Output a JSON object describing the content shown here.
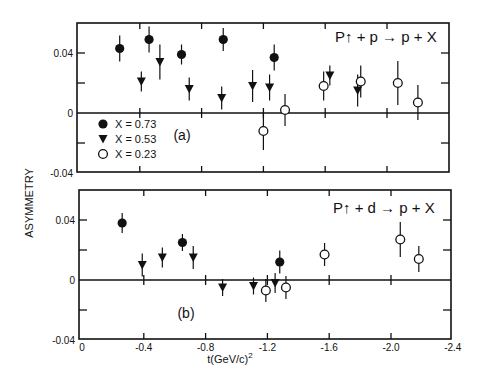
{
  "chart_data": {
    "type": "scatter",
    "ylabel": "ASYMMETRY",
    "xlabel": "t (GeV/c)^2",
    "xlabel_main": "t(GeV/c)",
    "xlabel_sup": "2",
    "xlim": [
      0,
      -2.4
    ],
    "x_ticks": [
      0,
      -0.4,
      -0.8,
      -1.2,
      -1.6,
      -2.0,
      -2.4
    ],
    "x_tick_labels": [
      "0",
      "-0.4",
      "-0.8",
      "-1.2",
      "-1.6",
      "-2.0",
      "-2.4"
    ],
    "y_ticks": [
      -0.04,
      0,
      0.04
    ],
    "y_tick_labels": [
      "-0.04",
      "0",
      "0.04"
    ],
    "grid": false,
    "legend": {
      "position": "upper-left of panel (a), below zero line",
      "entries": [
        {
          "marker": "filled-circle",
          "label": "X = 0.73"
        },
        {
          "marker": "filled-triangle-down",
          "label": "X = 0.53"
        },
        {
          "marker": "open-circle",
          "label": "X = 0.23"
        }
      ]
    },
    "panels": [
      {
        "id": "a",
        "panel_label": "(a)",
        "reaction": "P↑ + p → p + X",
        "ylim": [
          -0.04,
          0.06
        ],
        "series": [
          {
            "name": "X = 0.73",
            "marker": "filled-circle",
            "x": [
              -0.27,
              -0.46,
              -0.67,
              -0.94,
              -1.27
            ],
            "y": [
              0.043,
              0.049,
              0.039,
              0.049,
              0.037
            ],
            "err": [
              0.006,
              0.006,
              0.004,
              0.005,
              0.006
            ]
          },
          {
            "name": "X = 0.53",
            "marker": "filled-triangle-down",
            "x": [
              -0.41,
              -0.53,
              -0.72,
              -0.93,
              -1.13,
              -1.24,
              -1.63,
              -1.81
            ],
            "y": [
              0.021,
              0.034,
              0.016,
              0.01,
              0.018,
              0.017,
              0.025,
              0.015
            ],
            "err": [
              0.004,
              0.009,
              0.005,
              0.005,
              0.008,
              0.006,
              0.004,
              0.008
            ]
          },
          {
            "name": "X = 0.23",
            "marker": "open-circle",
            "x": [
              -1.2,
              -1.34,
              -1.59,
              -1.83,
              -2.07,
              -2.2
            ],
            "y": [
              -0.012,
              0.002,
              0.018,
              0.021,
              0.02,
              0.007
            ],
            "err": [
              0.01,
              0.008,
              0.007,
              0.008,
              0.012,
              0.009
            ]
          }
        ]
      },
      {
        "id": "b",
        "panel_label": "(b)",
        "reaction": "P↑ + d → p + X",
        "ylim": [
          -0.04,
          0.06
        ],
        "series": [
          {
            "name": "X = 0.73",
            "marker": "filled-circle",
            "x": [
              -0.26,
              -0.65,
              -1.28
            ],
            "y": [
              0.038,
              0.025,
              0.012
            ],
            "err": [
              0.004,
              0.003,
              0.005
            ]
          },
          {
            "name": "X = 0.53",
            "marker": "filled-triangle-down",
            "x": [
              -0.39,
              -0.52,
              -0.72,
              -0.91,
              -1.11,
              -1.25
            ],
            "y": [
              0.01,
              0.015,
              0.015,
              -0.005,
              -0.004,
              -0.002
            ],
            "err": [
              0.005,
              0.004,
              0.005,
              0.003,
              0.003,
              0.004
            ]
          },
          {
            "name": "X = 0.23",
            "marker": "open-circle",
            "x": [
              -1.19,
              -1.32,
              -1.57,
              -2.06,
              -2.18
            ],
            "y": [
              -0.007,
              -0.005,
              0.017,
              0.027,
              0.014
            ],
            "err": [
              0.005,
              0.005,
              0.005,
              0.009,
              0.006
            ]
          }
        ]
      }
    ]
  }
}
